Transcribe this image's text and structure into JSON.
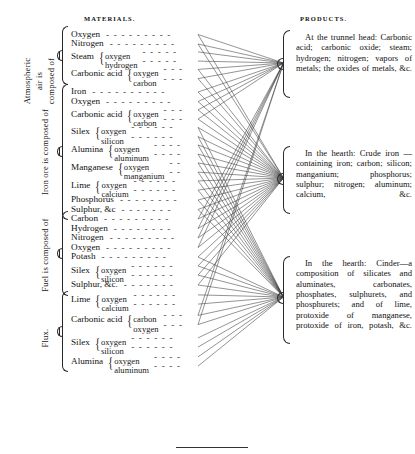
{
  "headers": {
    "materials": "MATERIALS.",
    "products": "PRODUCTS."
  },
  "groups": [
    {
      "id": "air",
      "label": "Atmospheric air is composed of",
      "label_lines": [
        "Atmospheric",
        "air is",
        "composed of"
      ]
    },
    {
      "id": "ore",
      "label": "Iron ore is composed of",
      "label_lines": [
        "Iron ore is composed of"
      ]
    },
    {
      "id": "fuel",
      "label": "Fuel is composed of",
      "label_lines": [
        "Fuel is composed of"
      ]
    },
    {
      "id": "flux",
      "label": "Flux.",
      "label_lines": [
        "Flux."
      ]
    }
  ],
  "materials": [
    {
      "name": "Oxygen",
      "group": "air",
      "leader": true,
      "parts": []
    },
    {
      "name": "Nitrogen",
      "group": "air",
      "leader": true,
      "parts": []
    },
    {
      "name": "Steam",
      "group": "air",
      "leader": false,
      "parts": [
        "oxygen",
        "hydrogen"
      ]
    },
    {
      "name": "Carbonic acid",
      "group": "air",
      "leader": false,
      "parts": [
        "oxygen",
        "carbon"
      ]
    },
    {
      "name": "Iron",
      "group": "ore",
      "leader": true,
      "parts": []
    },
    {
      "name": "Oxygen",
      "group": "ore",
      "leader": true,
      "parts": []
    },
    {
      "name": "Carbonic acid",
      "group": "ore",
      "leader": false,
      "parts": [
        "oxygen",
        "carbon"
      ]
    },
    {
      "name": "Silex",
      "group": "ore",
      "leader": false,
      "parts": [
        "oxygen",
        "silicon"
      ]
    },
    {
      "name": "Alumina",
      "group": "ore",
      "leader": false,
      "parts": [
        "oxygen",
        "aluminum"
      ]
    },
    {
      "name": "Manganese",
      "group": "ore",
      "leader": false,
      "parts": [
        "oxygen",
        "manganium"
      ]
    },
    {
      "name": "Lime",
      "group": "ore",
      "leader": false,
      "parts": [
        "oxygen",
        "calcium"
      ]
    },
    {
      "name": "Phosphorus",
      "group": "ore",
      "leader": true,
      "parts": []
    },
    {
      "name": "Sulphur, &c",
      "group": "ore",
      "leader": true,
      "parts": []
    },
    {
      "name": "Carbon",
      "group": "fuel",
      "leader": true,
      "parts": []
    },
    {
      "name": "Hydrogen",
      "group": "fuel",
      "leader": true,
      "parts": []
    },
    {
      "name": "Nitrogen",
      "group": "fuel",
      "leader": true,
      "parts": []
    },
    {
      "name": "Oxygen",
      "group": "fuel",
      "leader": true,
      "parts": []
    },
    {
      "name": "Potash",
      "group": "fuel",
      "leader": true,
      "parts": []
    },
    {
      "name": "Silex",
      "group": "fuel",
      "leader": false,
      "parts": [
        "oxygen",
        "silicon"
      ]
    },
    {
      "name": "Sulphur, &c.",
      "group": "fuel",
      "leader": true,
      "parts": []
    },
    {
      "name": "Lime",
      "group": "flux",
      "leader": false,
      "parts": [
        "oxygen",
        "calcium"
      ]
    },
    {
      "name": "Carbonic acid",
      "group": "flux",
      "leader": false,
      "parts": [
        "carbon",
        "oxygen"
      ]
    },
    {
      "name": "Silex",
      "group": "flux",
      "leader": false,
      "parts": [
        "oxygen",
        "silicon"
      ]
    },
    {
      "name": "Alumina",
      "group": "flux",
      "leader": false,
      "parts": [
        "oxygen",
        "aluminum"
      ]
    }
  ],
  "products": [
    {
      "id": "tunnel-head",
      "text": "At the trunnel head: Carbonic acid; carbonic oxide; steam; hydrogen; nitrogen; vapors of metals; the oxides of metals, &c."
    },
    {
      "id": "hearth-crude-iron",
      "text": "In the hearth: Crude iron — containing iron; carbon; silicon; manganium; phosphorus; sulphur; nitrogen; aluminum; calcium, &c."
    },
    {
      "id": "hearth-cinder",
      "text": "In the hearth: Cinder—a composition of silicates and aluminates, carbonates, phosphates, sulphurets, and phosphurets; and of lime, protoxide of manganese, protoxide of iron, potash, &c."
    }
  ],
  "colors": {
    "ink": "#121212",
    "rule": "#333333",
    "line": "#3a3a3a",
    "paper": "#ffffff"
  },
  "link_map": {
    "tunnel-head": [
      0,
      1,
      2,
      3,
      4,
      5,
      6,
      13,
      14,
      15,
      16,
      21
    ],
    "hearth-crude-iron": [
      0,
      1,
      3,
      4,
      5,
      6,
      7,
      8,
      9,
      10,
      11,
      12,
      13,
      14,
      15,
      16,
      17,
      18,
      19
    ],
    "hearth-cinder": [
      7,
      8,
      9,
      10,
      11,
      12,
      17,
      18,
      19,
      20,
      21,
      22,
      23
    ]
  }
}
